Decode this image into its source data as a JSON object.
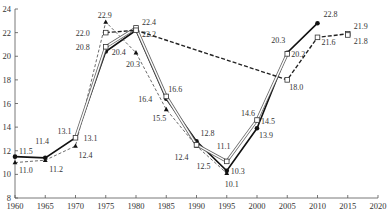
{
  "chart_data": {
    "type": "line",
    "title": "",
    "xlabel": "",
    "ylabel": "",
    "xlim": [
      1960,
      2020
    ],
    "ylim": [
      8,
      24
    ],
    "grid": false,
    "x_ticks": [
      "1960",
      "1965",
      "1970",
      "1975",
      "1980",
      "1985",
      "1990",
      "1995",
      "2000",
      "2005",
      "2010",
      "2015",
      "2020"
    ],
    "y_ticks": [
      "8",
      "10",
      "12",
      "14",
      "16",
      "18",
      "20",
      "22",
      "24"
    ],
    "series": [
      {
        "name": "series-solid-circle",
        "style": "solid",
        "marker": "filled-circle",
        "x": [
          1960,
          1965,
          1970,
          1975,
          1980,
          1985,
          1990,
          1995,
          2000,
          2005,
          2010
        ],
        "values": [
          11.5,
          11.4,
          13.1,
          20.4,
          22.2,
          16.4,
          12.8,
          10.3,
          13.9,
          20.3,
          22.8
        ]
      },
      {
        "name": "series-dashed-triangle",
        "style": "dashed",
        "marker": "filled-triangle",
        "x": [
          1960,
          1965,
          1970,
          1975,
          1980,
          1985,
          1990,
          1995
        ],
        "values": [
          11.0,
          11.2,
          12.4,
          22.9,
          20.3,
          15.5,
          12.4,
          10.1
        ]
      },
      {
        "name": "series-double-square",
        "style": "double",
        "marker": "open-square",
        "x": [
          1970,
          1975,
          1980,
          1985,
          1990,
          1995,
          2000,
          2005
        ],
        "values": [
          13.1,
          20.8,
          22.4,
          16.6,
          12.5,
          11.1,
          14.6,
          20.2
        ]
      },
      {
        "name": "series-dashed-square",
        "style": "dashed-bold",
        "marker": "open-square",
        "x": [
          1975,
          1980,
          2005,
          2010,
          2015,
          2015
        ],
        "values": [
          22.0,
          22.2,
          18.0,
          21.6,
          21.9,
          21.8
        ]
      }
    ],
    "annotations": [
      {
        "x": 1960,
        "y": 11.5,
        "text": "11.5",
        "dx": 4,
        "dy": -3
      },
      {
        "x": 1960,
        "y": 11.0,
        "text": "11.0",
        "dx": 4,
        "dy": 10
      },
      {
        "x": 1965,
        "y": 11.4,
        "text": "11.4",
        "dx": -10,
        "dy": -14
      },
      {
        "x": 1965,
        "y": 11.2,
        "text": "11.2",
        "dx": 4,
        "dy": 12
      },
      {
        "x": 1970,
        "y": 13.1,
        "text": "13.1",
        "dx": -18,
        "dy": -4
      },
      {
        "x": 1970,
        "y": 13.1,
        "text": "13.1",
        "dx": 8,
        "dy": 3
      },
      {
        "x": 1970,
        "y": 12.4,
        "text": "12.4",
        "dx": 3,
        "dy": 12
      },
      {
        "x": 1975,
        "y": 22.9,
        "text": "22.9",
        "dx": -8,
        "dy": -4
      },
      {
        "x": 1975,
        "y": 22.0,
        "text": "22.0",
        "dx": -30,
        "dy": 3
      },
      {
        "x": 1975,
        "y": 20.8,
        "text": "20.8",
        "dx": -30,
        "dy": 3
      },
      {
        "x": 1975,
        "y": 20.4,
        "text": "20.4",
        "dx": 6,
        "dy": 3
      },
      {
        "x": 1980,
        "y": 22.4,
        "text": "22.4",
        "dx": 6,
        "dy": -3
      },
      {
        "x": 1980,
        "y": 22.2,
        "text": "22.2",
        "dx": 6,
        "dy": 7
      },
      {
        "x": 1980,
        "y": 20.3,
        "text": "20.3",
        "dx": -10,
        "dy": 14
      },
      {
        "x": 1985,
        "y": 16.6,
        "text": "16.6",
        "dx": 2,
        "dy": -4
      },
      {
        "x": 1985,
        "y": 16.4,
        "text": "16.4",
        "dx": -28,
        "dy": 3
      },
      {
        "x": 1985,
        "y": 15.5,
        "text": "15.5",
        "dx": -14,
        "dy": 12
      },
      {
        "x": 1990,
        "y": 12.8,
        "text": "12.8",
        "dx": 4,
        "dy": -5
      },
      {
        "x": 1990,
        "y": 12.4,
        "text": "12.4",
        "dx": -22,
        "dy": 14
      },
      {
        "x": 1990,
        "y": 12.5,
        "text": "12.5",
        "dx": 0,
        "dy": 24
      },
      {
        "x": 1995,
        "y": 11.1,
        "text": "11.1",
        "dx": -10,
        "dy": -12
      },
      {
        "x": 1995,
        "y": 10.3,
        "text": "10.3",
        "dx": 4,
        "dy": 3
      },
      {
        "x": 1995,
        "y": 10.1,
        "text": "10.1",
        "dx": -2,
        "dy": 14
      },
      {
        "x": 2000,
        "y": 14.6,
        "text": "14.6",
        "dx": -16,
        "dy": -4
      },
      {
        "x": 2000,
        "y": 14.5,
        "text": "14.5",
        "dx": 4,
        "dy": 3
      },
      {
        "x": 2000,
        "y": 13.9,
        "text": "13.9",
        "dx": 2,
        "dy": 10
      },
      {
        "x": 2005,
        "y": 20.3,
        "text": "20.3",
        "dx": -16,
        "dy": -10
      },
      {
        "x": 2005,
        "y": 20.2,
        "text": "20.2",
        "dx": 4,
        "dy": 3
      },
      {
        "x": 2005,
        "y": 18.0,
        "text": "18.0",
        "dx": 2,
        "dy": 10
      },
      {
        "x": 2010,
        "y": 22.8,
        "text": "22.8",
        "dx": 6,
        "dy": -6
      },
      {
        "x": 2010,
        "y": 21.6,
        "text": "21.6",
        "dx": 4,
        "dy": 8
      },
      {
        "x": 2015,
        "y": 21.9,
        "text": "21.9",
        "dx": 6,
        "dy": -5
      },
      {
        "x": 2015,
        "y": 21.8,
        "text": "21.8",
        "dx": 6,
        "dy": 9
      }
    ]
  }
}
